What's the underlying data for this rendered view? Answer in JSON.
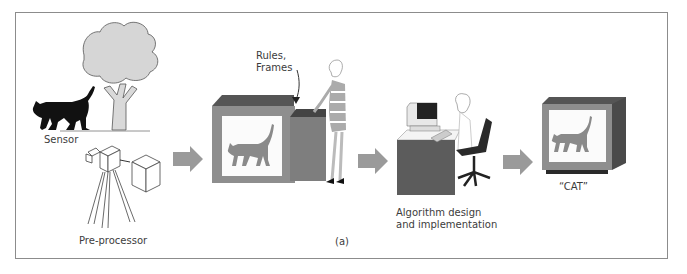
{
  "diagram": {
    "type": "pipeline",
    "caption": "(a)",
    "labels": {
      "sensor": "Sensor",
      "preprocessor": "Pre-processor",
      "rules": "Rules,",
      "frames": "Frames",
      "algorithm_line1": "Algorithm design",
      "algorithm_line2": "and implementation",
      "output": "“CAT”"
    },
    "stages": [
      {
        "id": "sensing",
        "label": "Sensor / Pre-processor",
        "icons": [
          "cat-icon",
          "tree-icon",
          "camera-icon",
          "processor-box-icon"
        ]
      },
      {
        "id": "knowledge",
        "label": "Rules, Frames",
        "icons": [
          "monitor-icon",
          "knowledge-box-icon",
          "person-icon"
        ]
      },
      {
        "id": "implementation",
        "label": "Algorithm design and implementation",
        "icons": [
          "desk-icon",
          "computer-icon",
          "programmer-icon",
          "chair-icon"
        ]
      },
      {
        "id": "output",
        "label": "“CAT”",
        "icons": [
          "monitor-icon"
        ]
      }
    ],
    "colors": {
      "frame": "#8c8c8c",
      "arrow": "#9a9a9a",
      "monitor_body": "#8e8e8e",
      "monitor_top": "#5a5a5a",
      "monitor_side": "#6e6e6e",
      "desk": "#5c5c5c",
      "cat_silhouette": "#111111",
      "cat_screen": "#8a8a8a",
      "tree_foliage": "#d6d6d6"
    }
  }
}
